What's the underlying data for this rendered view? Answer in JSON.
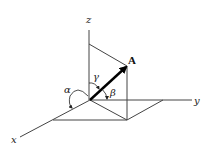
{
  "diagram": {
    "axes": {
      "x_label": "x",
      "y_label": "y",
      "z_label": "z"
    },
    "vector": {
      "label": "A"
    },
    "angles": {
      "alpha": "α",
      "beta": "β",
      "gamma": "γ"
    },
    "colors": {
      "line": "#444444",
      "vector": "#000000",
      "background": "#ffffff"
    }
  }
}
